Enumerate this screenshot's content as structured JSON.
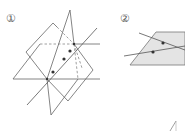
{
  "figures": [
    {
      "id": "figure-1",
      "label": "①",
      "description": "Two planes intersecting along a line containing three points"
    },
    {
      "id": "figure-2",
      "label": "②",
      "description": "Plane containing two intersecting lines, each with a marked point"
    }
  ],
  "fragment": {
    "text": "/"
  },
  "colors": {
    "stroke": "#666666",
    "dashed": "#888888",
    "point": "#333333",
    "plane_fill": "#e4e4e4"
  }
}
